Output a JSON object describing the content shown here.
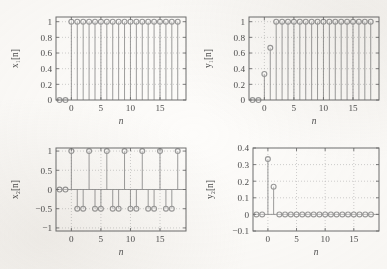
{
  "figure": {
    "type": "multi-panel-stem-plot",
    "panels": 4,
    "layout": "2x2",
    "xlabel": "n",
    "background": "#fdfcfa",
    "line_color": "#8d8d8d",
    "marker_color": "#9a9a9a",
    "grid_color": "#bdbdbd"
  },
  "chart_data": [
    {
      "type": "scatter",
      "id": "x1",
      "title": "",
      "xlabel": "n",
      "ylabel": "x₁[n]",
      "ylabel_plain": "x1[n]",
      "xlim": [
        -2.6,
        19.4
      ],
      "ylim": [
        0,
        1.06
      ],
      "xticks": [
        0,
        5,
        10,
        15
      ],
      "xticklabels": [
        "0",
        "5",
        "10",
        "15"
      ],
      "yticks": [
        0,
        0.2,
        0.4,
        0.6,
        0.8,
        1
      ],
      "yticklabels": [
        "0",
        "0.2",
        "0.4",
        "0.6",
        "0.8",
        "1"
      ],
      "grid": true,
      "x": [
        -2,
        -1,
        0,
        1,
        2,
        3,
        4,
        5,
        6,
        7,
        8,
        9,
        10,
        11,
        12,
        13,
        14,
        15,
        16,
        17,
        18
      ],
      "values": [
        0,
        0,
        1,
        1,
        1,
        1,
        1,
        1,
        1,
        1,
        1,
        1,
        1,
        1,
        1,
        1,
        1,
        1,
        1,
        1,
        1
      ]
    },
    {
      "type": "scatter",
      "id": "y1",
      "title": "",
      "xlabel": "n",
      "ylabel": "y₁[n]",
      "ylabel_plain": "y1[n]",
      "xlim": [
        -2.6,
        19.4
      ],
      "ylim": [
        0,
        1.06
      ],
      "xticks": [
        0,
        5,
        10,
        15
      ],
      "xticklabels": [
        "0",
        "5",
        "10",
        "15"
      ],
      "yticks": [
        0,
        0.2,
        0.4,
        0.6,
        0.8,
        1
      ],
      "yticklabels": [
        "0",
        "0.2",
        "0.4",
        "0.6",
        "0.8",
        "1"
      ],
      "grid": true,
      "x": [
        -2,
        -1,
        0,
        1,
        2,
        3,
        4,
        5,
        6,
        7,
        8,
        9,
        10,
        11,
        12,
        13,
        14,
        15,
        16,
        17,
        18
      ],
      "values": [
        0,
        0,
        0.333,
        0.667,
        1,
        1,
        1,
        1,
        1,
        1,
        1,
        1,
        1,
        1,
        1,
        1,
        1,
        1,
        1,
        1,
        1
      ]
    },
    {
      "type": "scatter",
      "id": "x2",
      "title": "",
      "xlabel": "n",
      "ylabel": "x₂[n]",
      "ylabel_plain": "x2[n]",
      "xlim": [
        -2.6,
        19.4
      ],
      "ylim": [
        -1.08,
        1.08
      ],
      "xticks": [
        0,
        5,
        10,
        15
      ],
      "xticklabels": [
        "0",
        "5",
        "10",
        "15"
      ],
      "yticks": [
        -1,
        -0.5,
        0,
        0.5,
        1
      ],
      "yticklabels": [
        "−1",
        "−0.5",
        "0",
        "0.5",
        "1"
      ],
      "grid": true,
      "x": [
        -2,
        -1,
        0,
        1,
        2,
        3,
        4,
        5,
        6,
        7,
        8,
        9,
        10,
        11,
        12,
        13,
        14,
        15,
        16,
        17,
        18
      ],
      "values": [
        0,
        0,
        1,
        -0.5,
        -0.5,
        1,
        -0.5,
        -0.5,
        1,
        -0.5,
        -0.5,
        1,
        -0.5,
        -0.5,
        1,
        -0.5,
        -0.5,
        1,
        -0.5,
        -0.5,
        1
      ]
    },
    {
      "type": "scatter",
      "id": "y2",
      "title": "",
      "xlabel": "n",
      "ylabel": "y₂[n]",
      "ylabel_plain": "y2[n]",
      "xlim": [
        -2.6,
        19.4
      ],
      "ylim": [
        -0.1,
        0.4
      ],
      "xticks": [
        0,
        5,
        10,
        15
      ],
      "xticklabels": [
        "0",
        "5",
        "10",
        "15"
      ],
      "yticks": [
        -0.1,
        0,
        0.1,
        0.2,
        0.3,
        0.4
      ],
      "yticklabels": [
        "−0.1",
        "0",
        "0.1",
        "0.2",
        "0.3",
        "0.4"
      ],
      "grid": true,
      "x": [
        -2,
        -1,
        0,
        1,
        2,
        3,
        4,
        5,
        6,
        7,
        8,
        9,
        10,
        11,
        12,
        13,
        14,
        15,
        16,
        17,
        18
      ],
      "values": [
        0,
        0,
        0.333,
        0.167,
        0,
        0,
        0,
        0,
        0,
        0,
        0,
        0,
        0,
        0,
        0,
        0,
        0,
        0,
        0,
        0,
        0
      ]
    }
  ]
}
